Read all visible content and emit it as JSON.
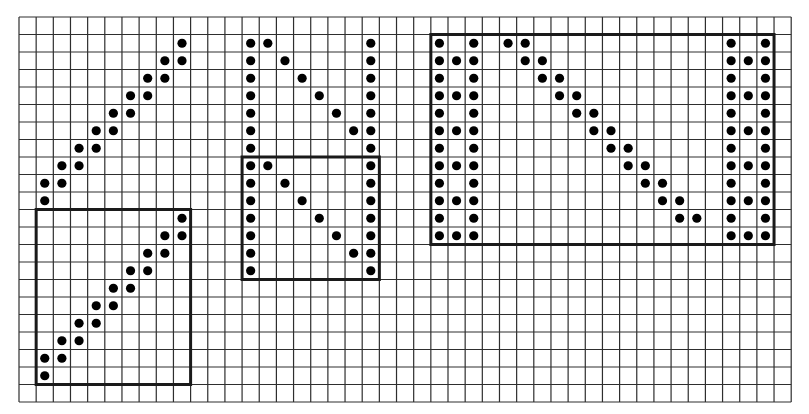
{
  "grid": {
    "cols": 45,
    "rows": 22,
    "origin_x": 19,
    "origin_y": 17,
    "cell_w": 17.16,
    "cell_h": 17.5,
    "line_color": "#2e2e2e",
    "box_color": "#1a1a1a",
    "dot_color": "#000000"
  },
  "figures": [
    {
      "name": "diagonal-figure-top",
      "box": null,
      "dots": [
        [
          1,
          9
        ],
        [
          2,
          8
        ],
        [
          2,
          9
        ],
        [
          3,
          7
        ],
        [
          3,
          8
        ],
        [
          4,
          6
        ],
        [
          4,
          7
        ],
        [
          5,
          5
        ],
        [
          5,
          6
        ],
        [
          6,
          4
        ],
        [
          6,
          5
        ],
        [
          7,
          3
        ],
        [
          7,
          4
        ],
        [
          8,
          2
        ],
        [
          8,
          3
        ],
        [
          9,
          1
        ],
        [
          9,
          2
        ],
        [
          10,
          1
        ]
      ]
    },
    {
      "name": "diagonal-figure-boxed",
      "box": {
        "col0": 1,
        "row0": 11,
        "col1": 10,
        "row1": 21
      },
      "dots": [
        [
          11,
          9
        ],
        [
          12,
          8
        ],
        [
          12,
          9
        ],
        [
          13,
          7
        ],
        [
          13,
          8
        ],
        [
          14,
          6
        ],
        [
          14,
          7
        ],
        [
          15,
          5
        ],
        [
          15,
          6
        ],
        [
          16,
          4
        ],
        [
          16,
          5
        ],
        [
          17,
          3
        ],
        [
          17,
          4
        ],
        [
          18,
          2
        ],
        [
          18,
          3
        ],
        [
          19,
          1
        ],
        [
          19,
          2
        ],
        [
          20,
          1
        ]
      ]
    },
    {
      "name": "n-figure-top",
      "box": null,
      "dots": [
        [
          1,
          13
        ],
        [
          1,
          14
        ],
        [
          1,
          20
        ],
        [
          2,
          13
        ],
        [
          2,
          15
        ],
        [
          2,
          20
        ],
        [
          3,
          13
        ],
        [
          3,
          16
        ],
        [
          3,
          20
        ],
        [
          4,
          13
        ],
        [
          4,
          17
        ],
        [
          4,
          20
        ],
        [
          5,
          13
        ],
        [
          5,
          18
        ],
        [
          5,
          20
        ],
        [
          6,
          13
        ],
        [
          6,
          19
        ],
        [
          6,
          20
        ],
        [
          7,
          13
        ],
        [
          7,
          20
        ]
      ]
    },
    {
      "name": "n-figure-boxed",
      "box": {
        "col0": 13,
        "row0": 8,
        "col1": 21,
        "row1": 15
      },
      "dots": [
        [
          8,
          13
        ],
        [
          8,
          14
        ],
        [
          8,
          20
        ],
        [
          9,
          13
        ],
        [
          9,
          15
        ],
        [
          9,
          20
        ],
        [
          10,
          13
        ],
        [
          10,
          16
        ],
        [
          10,
          20
        ],
        [
          11,
          13
        ],
        [
          11,
          17
        ],
        [
          11,
          20
        ],
        [
          12,
          13
        ],
        [
          12,
          18
        ],
        [
          12,
          20
        ],
        [
          13,
          13
        ],
        [
          13,
          19
        ],
        [
          13,
          20
        ],
        [
          14,
          13
        ],
        [
          14,
          20
        ]
      ]
    },
    {
      "name": "wide-n-figure-boxed",
      "box": {
        "col0": 24,
        "row0": 1,
        "col1": 44,
        "row1": 13
      },
      "dots": [
        [
          1,
          24
        ],
        [
          2,
          24
        ],
        [
          3,
          24
        ],
        [
          4,
          24
        ],
        [
          5,
          24
        ],
        [
          6,
          24
        ],
        [
          7,
          24
        ],
        [
          8,
          24
        ],
        [
          9,
          24
        ],
        [
          10,
          24
        ],
        [
          11,
          24
        ],
        [
          12,
          24
        ],
        [
          2,
          25
        ],
        [
          4,
          25
        ],
        [
          6,
          25
        ],
        [
          8,
          25
        ],
        [
          10,
          25
        ],
        [
          12,
          25
        ],
        [
          1,
          26
        ],
        [
          2,
          26
        ],
        [
          3,
          26
        ],
        [
          4,
          26
        ],
        [
          5,
          26
        ],
        [
          6,
          26
        ],
        [
          7,
          26
        ],
        [
          8,
          26
        ],
        [
          9,
          26
        ],
        [
          10,
          26
        ],
        [
          11,
          26
        ],
        [
          12,
          26
        ],
        [
          1,
          28
        ],
        [
          1,
          29
        ],
        [
          2,
          29
        ],
        [
          2,
          30
        ],
        [
          3,
          30
        ],
        [
          3,
          31
        ],
        [
          4,
          31
        ],
        [
          4,
          32
        ],
        [
          5,
          32
        ],
        [
          5,
          33
        ],
        [
          6,
          33
        ],
        [
          6,
          34
        ],
        [
          7,
          34
        ],
        [
          7,
          35
        ],
        [
          8,
          35
        ],
        [
          8,
          36
        ],
        [
          9,
          36
        ],
        [
          9,
          37
        ],
        [
          10,
          37
        ],
        [
          10,
          38
        ],
        [
          11,
          38
        ],
        [
          11,
          39
        ],
        [
          1,
          41
        ],
        [
          2,
          41
        ],
        [
          3,
          41
        ],
        [
          4,
          41
        ],
        [
          5,
          41
        ],
        [
          6,
          41
        ],
        [
          7,
          41
        ],
        [
          8,
          41
        ],
        [
          9,
          41
        ],
        [
          10,
          41
        ],
        [
          11,
          41
        ],
        [
          12,
          41
        ],
        [
          2,
          42
        ],
        [
          4,
          42
        ],
        [
          6,
          42
        ],
        [
          8,
          42
        ],
        [
          10,
          42
        ],
        [
          12,
          42
        ],
        [
          1,
          43
        ],
        [
          2,
          43
        ],
        [
          3,
          43
        ],
        [
          4,
          43
        ],
        [
          5,
          43
        ],
        [
          6,
          43
        ],
        [
          7,
          43
        ],
        [
          8,
          43
        ],
        [
          9,
          43
        ],
        [
          10,
          43
        ],
        [
          11,
          43
        ],
        [
          12,
          43
        ]
      ]
    }
  ]
}
